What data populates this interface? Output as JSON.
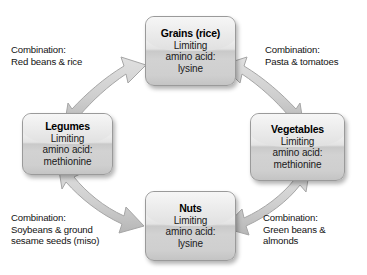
{
  "diagram": {
    "type": "complementary-protein-cycle",
    "nodes": [
      {
        "id": "grains",
        "title": "Grains (rice)",
        "lines": [
          "Limiting",
          "amino acid:",
          "lysine"
        ],
        "limiting_amino_acid": "lysine",
        "position": "top"
      },
      {
        "id": "legumes",
        "title": "Legumes",
        "lines": [
          "Limiting",
          "amino acid:",
          "methionine"
        ],
        "limiting_amino_acid": "methionine",
        "position": "left"
      },
      {
        "id": "vegetables",
        "title": "Vegetables",
        "lines": [
          "Limiting",
          "amino acid:",
          "methionine"
        ],
        "limiting_amino_acid": "methionine",
        "position": "right"
      },
      {
        "id": "nuts",
        "title": "Nuts",
        "lines": [
          "Limiting",
          "amino acid:",
          "lysine"
        ],
        "limiting_amino_acid": "lysine",
        "position": "bottom"
      }
    ],
    "connections": [
      {
        "id": "legumes-grains",
        "from": "legumes",
        "to": "grains",
        "arrow": "double-headed",
        "label_lines": [
          "Combination:",
          "Red beans & rice"
        ],
        "corner": "top-left"
      },
      {
        "id": "grains-vegetables",
        "from": "grains",
        "to": "vegetables",
        "arrow": "double-headed",
        "label_lines": [
          "Combination:",
          "Pasta & tomatoes"
        ],
        "corner": "top-right"
      },
      {
        "id": "legumes-nuts",
        "from": "legumes",
        "to": "nuts",
        "arrow": "double-headed",
        "label_lines": [
          "Combination:",
          "Soybeans & ground",
          "sesame seeds (miso)"
        ],
        "corner": "bottom-left"
      },
      {
        "id": "nuts-vegetables",
        "from": "nuts",
        "to": "vegetables",
        "arrow": "double-headed",
        "label_lines": [
          "Combination:",
          "Green beans &",
          "almonds"
        ],
        "corner": "bottom-right"
      }
    ],
    "colors": {
      "background": "#ffffff",
      "box_light": "#f2f2f2",
      "box_dark": "#c9c9c9",
      "box_border": "#9a9a9a",
      "arrow_fill": "#d0d0d0",
      "arrow_stroke": "#a6a6a6",
      "text": "#121212"
    }
  }
}
